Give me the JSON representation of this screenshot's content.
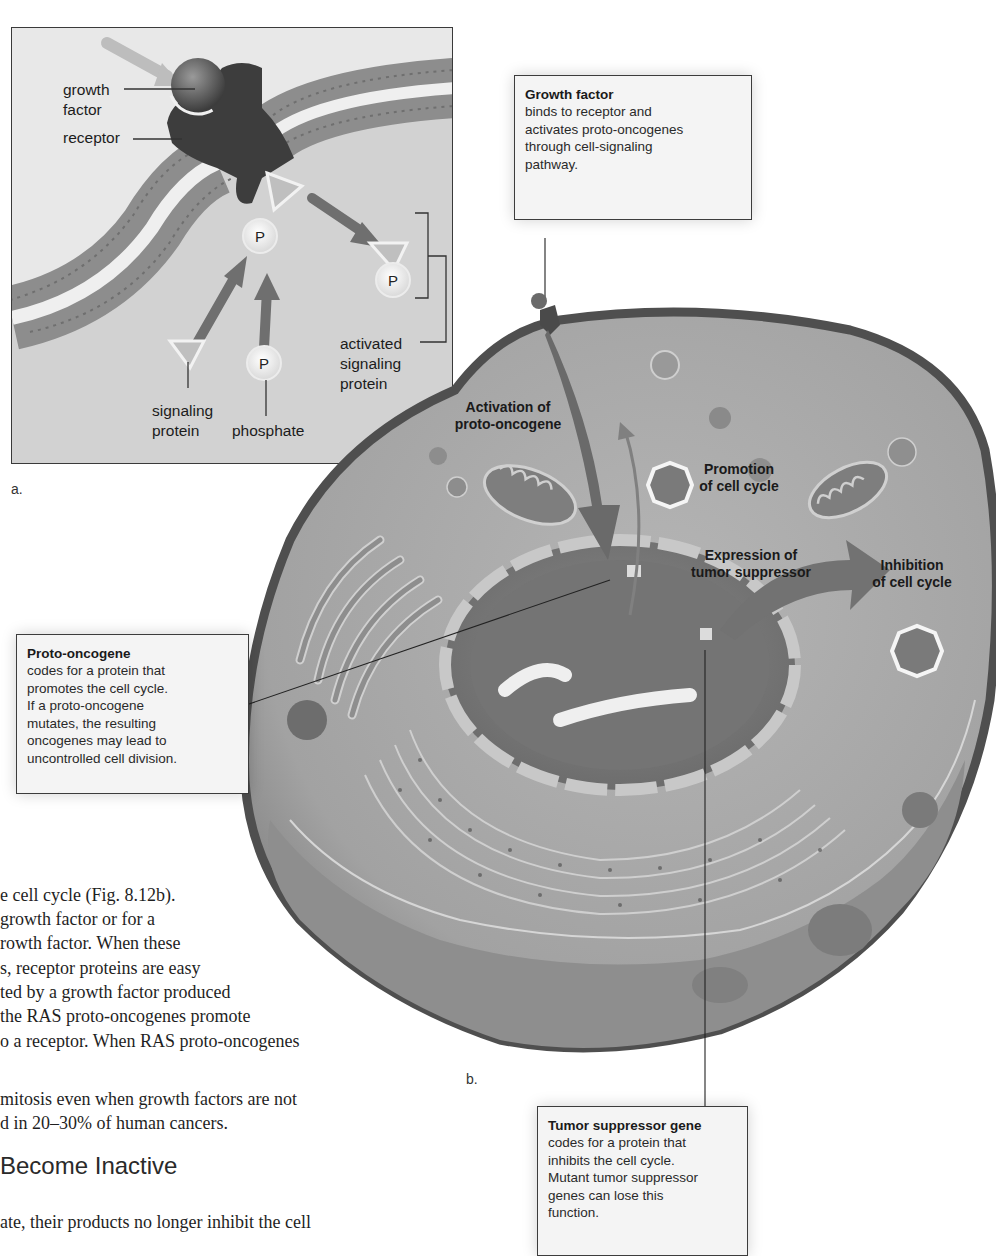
{
  "figure": {
    "panel_a": {
      "letter": "a.",
      "labels": {
        "growth_factor": [
          "growth",
          "factor"
        ],
        "receptor": "receptor",
        "signaling_protein": [
          "signaling",
          "protein"
        ],
        "phosphate": "phosphate",
        "activated_signaling_protein": [
          "activated",
          "signaling",
          "protein"
        ],
        "phosphate_symbol": "P"
      }
    },
    "panel_b": {
      "letter": "b.",
      "labels": {
        "activation": [
          "Activation of",
          "proto-oncogene"
        ],
        "promotion": [
          "Promotion",
          "of cell cycle"
        ],
        "expression": [
          "Expression of",
          "tumor suppressor"
        ],
        "inhibition": [
          "Inhibition",
          "of cell cycle"
        ]
      }
    },
    "callouts": {
      "growth_factor": {
        "title": "Growth factor",
        "lines": [
          "binds to receptor and",
          "activates proto-oncogenes",
          "through cell-signaling",
          "pathway."
        ]
      },
      "proto_oncogene": {
        "title": "Proto-oncogene",
        "lines": [
          "codes for a protein that",
          "promotes the cell cycle.",
          "If a proto-oncogene",
          "mutates, the resulting",
          "oncogenes may lead to",
          "uncontrolled cell division."
        ]
      },
      "tumor_suppressor": {
        "title": "Tumor suppressor gene",
        "lines": [
          "codes for a protein that",
          "inhibits the cell cycle.",
          "Mutant tumor suppressor",
          "genes can lose this",
          "function."
        ]
      }
    }
  },
  "body_text": {
    "paragraph_lines": [
      "e cell cycle (Fig. 8.12b).",
      " growth factor or for a",
      "rowth factor. When these",
      "s, receptor proteins are easy",
      "ted by a growth factor produced",
      " the RAS proto-oncogenes promote",
      "o a receptor. When RAS proto-oncogenes",
      " mitosis even when growth factors are not",
      "d in 20–30% of human cancers."
    ],
    "heading": "Become Inactive",
    "after_heading": "ate, their products no longer inhibit the cell"
  },
  "colors": {
    "cell_cytoplasm": "#a9a9a9",
    "cell_membrane": "#5a5a5a",
    "nucleus": "#7b7b7b",
    "callout_bg": "#f4f4f4",
    "panel_bg": "#cfcfcf",
    "arrow": "#6e6e6e"
  }
}
